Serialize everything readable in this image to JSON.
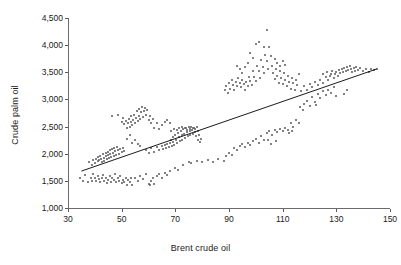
{
  "chart_data": {
    "type": "scatter",
    "title": "",
    "xlabel": "Brent crude oil",
    "ylabel": "Crude palm oil",
    "xlim": [
      30,
      150
    ],
    "ylim": [
      1000,
      4500
    ],
    "xticks": [
      30,
      50,
      70,
      90,
      110,
      130,
      150
    ],
    "xtick_labels": [
      "30",
      "50",
      "70",
      "90",
      "110",
      "130",
      "150"
    ],
    "yticks": [
      1000,
      1500,
      2000,
      2500,
      3000,
      3500,
      4000,
      4500
    ],
    "ytick_labels": [
      "1,000",
      "1,500",
      "2,000",
      "2,500",
      "3,000",
      "3,500",
      "4,000",
      "4,500"
    ],
    "grid": false,
    "legend": null,
    "marker_color": "#58595b",
    "line_color": "#000000",
    "trendline": {
      "x": [
        35,
        145
      ],
      "y": [
        1680,
        3560
      ]
    },
    "points": [
      [
        34.5,
        1555
      ],
      [
        35.5,
        1500
      ],
      [
        36.5,
        1600
      ],
      [
        37.5,
        1470
      ],
      [
        38.5,
        1560
      ],
      [
        39.0,
        1505
      ],
      [
        39.5,
        1620
      ],
      [
        40.0,
        1545
      ],
      [
        40.5,
        1490
      ],
      [
        41.0,
        1585
      ],
      [
        41.5,
        1530
      ],
      [
        42.0,
        1470
      ],
      [
        42.5,
        1560
      ],
      [
        43.0,
        1600
      ],
      [
        43.5,
        1505
      ],
      [
        44.0,
        1545
      ],
      [
        44.5,
        1455
      ],
      [
        45.0,
        1520
      ],
      [
        45.5,
        1590
      ],
      [
        46.0,
        1475
      ],
      [
        46.5,
        1550
      ],
      [
        47.0,
        1510
      ],
      [
        47.5,
        1620
      ],
      [
        48.0,
        1470
      ],
      [
        48.5,
        1545
      ],
      [
        49.0,
        1500
      ],
      [
        49.5,
        1590
      ],
      [
        50.0,
        1455
      ],
      [
        50.5,
        1520
      ],
      [
        51.0,
        1480
      ],
      [
        51.5,
        1560
      ],
      [
        52.0,
        1430
      ],
      [
        52.5,
        1510
      ],
      [
        53.0,
        1470
      ],
      [
        53.5,
        1545
      ],
      [
        54.0,
        1425
      ],
      [
        55.0,
        1560
      ],
      [
        56.0,
        1505
      ],
      [
        57.0,
        1590
      ],
      [
        58.0,
        1540
      ],
      [
        59.0,
        1620
      ],
      [
        60.0,
        1445
      ],
      [
        60.5,
        1420
      ],
      [
        61.0,
        1490
      ],
      [
        61.5,
        1560
      ],
      [
        62.0,
        1440
      ],
      [
        63.0,
        1590
      ],
      [
        64.0,
        1620
      ],
      [
        65.0,
        1560
      ],
      [
        66.0,
        1650
      ],
      [
        67.0,
        1600
      ],
      [
        68.0,
        1680
      ],
      [
        70.0,
        1740
      ],
      [
        71.0,
        1700
      ],
      [
        73.0,
        1790
      ],
      [
        75.0,
        1845
      ],
      [
        76.0,
        1820
      ],
      [
        78.0,
        1860
      ],
      [
        38.0,
        1840
      ],
      [
        39.0,
        1790
      ],
      [
        39.5,
        1880
      ],
      [
        40.0,
        1830
      ],
      [
        40.5,
        1905
      ],
      [
        41.0,
        1860
      ],
      [
        41.3,
        1935
      ],
      [
        41.6,
        1880
      ],
      [
        42.0,
        1960
      ],
      [
        42.3,
        1905
      ],
      [
        42.6,
        1845
      ],
      [
        43.0,
        1990
      ],
      [
        43.3,
        1930
      ],
      [
        43.6,
        1875
      ],
      [
        44.0,
        2015
      ],
      [
        44.2,
        1955
      ],
      [
        44.5,
        1900
      ],
      [
        44.8,
        2040
      ],
      [
        45.0,
        1980
      ],
      [
        45.2,
        1925
      ],
      [
        45.5,
        2060
      ],
      [
        45.8,
        2000
      ],
      [
        46.0,
        1945
      ],
      [
        46.3,
        2085
      ],
      [
        46.6,
        2020
      ],
      [
        47.0,
        1960
      ],
      [
        47.3,
        2105
      ],
      [
        47.6,
        2045
      ],
      [
        48.0,
        1985
      ],
      [
        48.3,
        2125
      ],
      [
        48.6,
        2060
      ],
      [
        49.0,
        2000
      ],
      [
        49.5,
        2080
      ],
      [
        50.0,
        2040
      ],
      [
        50.5,
        2110
      ],
      [
        51.0,
        2055
      ],
      [
        46.5,
        2700
      ],
      [
        48.5,
        2720
      ],
      [
        50.0,
        2590
      ],
      [
        50.5,
        2650
      ],
      [
        51.0,
        2540
      ],
      [
        51.5,
        2610
      ],
      [
        52.0,
        2480
      ],
      [
        52.3,
        2560
      ],
      [
        52.6,
        2640
      ],
      [
        53.0,
        2500
      ],
      [
        53.3,
        2580
      ],
      [
        53.6,
        2690
      ],
      [
        54.0,
        2520
      ],
      [
        54.3,
        2620
      ],
      [
        54.6,
        2720
      ],
      [
        55.0,
        2560
      ],
      [
        55.3,
        2660
      ],
      [
        55.6,
        2780
      ],
      [
        56.0,
        2600
      ],
      [
        56.3,
        2700
      ],
      [
        56.6,
        2820
      ],
      [
        57.0,
        2640
      ],
      [
        57.3,
        2760
      ],
      [
        57.6,
        2860
      ],
      [
        58.0,
        2680
      ],
      [
        58.3,
        2790
      ],
      [
        58.6,
        2840
      ],
      [
        59.0,
        2720
      ],
      [
        59.5,
        2800
      ],
      [
        60.0,
        2620
      ],
      [
        60.5,
        2700
      ],
      [
        61.0,
        2560
      ],
      [
        61.5,
        2640
      ],
      [
        62.0,
        2480
      ],
      [
        63.0,
        2560
      ],
      [
        64.0,
        2460
      ],
      [
        65.0,
        2520
      ],
      [
        66.0,
        2580
      ],
      [
        67.0,
        2620
      ],
      [
        68.0,
        2560
      ],
      [
        52.0,
        2280
      ],
      [
        53.0,
        2340
      ],
      [
        54.0,
        2200
      ],
      [
        55.0,
        2260
      ],
      [
        56.0,
        2180
      ],
      [
        57.0,
        2140
      ],
      [
        59.0,
        2060
      ],
      [
        60.0,
        2020
      ],
      [
        61.0,
        2100
      ],
      [
        62.0,
        2040
      ],
      [
        63.0,
        2120
      ],
      [
        64.0,
        2060
      ],
      [
        65.0,
        2140
      ],
      [
        65.5,
        2080
      ],
      [
        66.0,
        2160
      ],
      [
        66.5,
        2100
      ],
      [
        67.0,
        2180
      ],
      [
        67.5,
        2120
      ],
      [
        68.0,
        2200
      ],
      [
        68.3,
        2260
      ],
      [
        68.6,
        2150
      ],
      [
        69.0,
        2300
      ],
      [
        69.3,
        2220
      ],
      [
        69.6,
        2160
      ],
      [
        70.0,
        2340
      ],
      [
        70.3,
        2260
      ],
      [
        70.6,
        2190
      ],
      [
        71.0,
        2380
      ],
      [
        71.3,
        2300
      ],
      [
        71.6,
        2230
      ],
      [
        72.0,
        2420
      ],
      [
        72.3,
        2340
      ],
      [
        72.6,
        2260
      ],
      [
        73.0,
        2450
      ],
      [
        73.3,
        2370
      ],
      [
        73.6,
        2290
      ],
      [
        74.0,
        2470
      ],
      [
        74.3,
        2400
      ],
      [
        74.6,
        2320
      ],
      [
        75.0,
        2490
      ],
      [
        75.3,
        2420
      ],
      [
        75.6,
        2350
      ],
      [
        76.0,
        2500
      ],
      [
        76.3,
        2440
      ],
      [
        76.6,
        2370
      ],
      [
        77.0,
        2470
      ],
      [
        77.3,
        2400
      ],
      [
        77.6,
        2330
      ],
      [
        78.0,
        2490
      ],
      [
        78.3,
        2420
      ],
      [
        78.6,
        2260
      ],
      [
        79.0,
        2350
      ],
      [
        79.3,
        2210
      ],
      [
        79.6,
        2280
      ],
      [
        68.5,
        2420
      ],
      [
        69.5,
        2460
      ],
      [
        70.5,
        2440
      ],
      [
        71.5,
        2480
      ],
      [
        72.5,
        2500
      ],
      [
        73.5,
        2470
      ],
      [
        74.5,
        2440
      ],
      [
        75.5,
        2460
      ],
      [
        76.5,
        2480
      ],
      [
        77.5,
        2450
      ],
      [
        80.0,
        1850
      ],
      [
        82.0,
        1880
      ],
      [
        84.0,
        1840
      ],
      [
        86.0,
        1900
      ],
      [
        88.0,
        1860
      ],
      [
        89.0,
        1960
      ],
      [
        90.0,
        2020
      ],
      [
        91.0,
        1980
      ],
      [
        92.0,
        2100
      ],
      [
        93.0,
        2060
      ],
      [
        94.0,
        2140
      ],
      [
        95.0,
        2180
      ],
      [
        96.0,
        2120
      ],
      [
        97.0,
        2200
      ],
      [
        98.0,
        2160
      ],
      [
        99.0,
        2240
      ],
      [
        100.0,
        2280
      ],
      [
        101.0,
        2200
      ],
      [
        102.0,
        2320
      ],
      [
        103.0,
        2260
      ],
      [
        104.0,
        2380
      ],
      [
        105.0,
        2420
      ],
      [
        106.0,
        2340
      ],
      [
        107.0,
        2440
      ],
      [
        108.0,
        2400
      ],
      [
        109.0,
        2460
      ],
      [
        110.0,
        2420
      ],
      [
        111.0,
        2480
      ],
      [
        112.0,
        2440
      ],
      [
        113.0,
        2560
      ],
      [
        114.0,
        2500
      ],
      [
        115.0,
        2620
      ],
      [
        116.0,
        2560
      ],
      [
        104.5,
        2260
      ],
      [
        105.5,
        2180
      ],
      [
        107.5,
        2240
      ],
      [
        112.5,
        2380
      ],
      [
        113.5,
        2420
      ],
      [
        88.5,
        3180
      ],
      [
        89.0,
        3240
      ],
      [
        89.5,
        3120
      ],
      [
        90.0,
        3300
      ],
      [
        90.5,
        3200
      ],
      [
        91.0,
        3350
      ],
      [
        91.5,
        3260
      ],
      [
        92.0,
        3180
      ],
      [
        92.5,
        3320
      ],
      [
        93.0,
        3240
      ],
      [
        93.5,
        3400
      ],
      [
        94.0,
        3300
      ],
      [
        94.5,
        3220
      ],
      [
        95.0,
        3360
      ],
      [
        95.5,
        3280
      ],
      [
        96.0,
        3180
      ],
      [
        96.5,
        3320
      ],
      [
        97.0,
        3240
      ],
      [
        97.5,
        3420
      ],
      [
        98.0,
        3340
      ],
      [
        98.5,
        3260
      ],
      [
        99.0,
        3520
      ],
      [
        99.5,
        3420
      ],
      [
        100.0,
        3340
      ],
      [
        100.5,
        3620
      ],
      [
        101.0,
        3520
      ],
      [
        101.5,
        3400
      ],
      [
        102.0,
        3720
      ],
      [
        102.5,
        3600
      ],
      [
        103.0,
        3480
      ],
      [
        103.5,
        3820
      ],
      [
        104.0,
        3700
      ],
      [
        104.5,
        3560
      ],
      [
        105.0,
        3960
      ],
      [
        105.5,
        3800
      ],
      [
        106.0,
        3620
      ],
      [
        100.0,
        4030
      ],
      [
        101.0,
        4060
      ],
      [
        103.0,
        3960
      ],
      [
        104.0,
        4280
      ],
      [
        98.0,
        3860
      ],
      [
        99.0,
        3760
      ],
      [
        97.0,
        3680
      ],
      [
        96.0,
        3600
      ],
      [
        106.5,
        3480
      ],
      [
        107.0,
        3380
      ],
      [
        107.5,
        3560
      ],
      [
        108.0,
        3440
      ],
      [
        108.5,
        3300
      ],
      [
        109.0,
        3520
      ],
      [
        109.5,
        3400
      ],
      [
        110.0,
        3280
      ],
      [
        110.5,
        3480
      ],
      [
        111.0,
        3360
      ],
      [
        111.5,
        3240
      ],
      [
        112.0,
        3440
      ],
      [
        112.5,
        3320
      ],
      [
        113.0,
        3200
      ],
      [
        113.5,
        3400
      ],
      [
        114.0,
        3300
      ],
      [
        114.5,
        3180
      ],
      [
        115.0,
        3360
      ],
      [
        115.5,
        3260
      ],
      [
        116.0,
        3460
      ],
      [
        107.0,
        3740
      ],
      [
        108.0,
        3680
      ],
      [
        109.0,
        3620
      ],
      [
        110.0,
        3700
      ],
      [
        111.0,
        3640
      ],
      [
        94.0,
        3560
      ],
      [
        95.0,
        3480
      ],
      [
        93.0,
        3620
      ],
      [
        117.0,
        3160
      ],
      [
        118.0,
        3240
      ],
      [
        119.0,
        3180
      ],
      [
        120.0,
        3280
      ],
      [
        121.0,
        3220
      ],
      [
        122.0,
        3320
      ],
      [
        123.0,
        3260
      ],
      [
        124.0,
        3360
      ],
      [
        125.0,
        3300
      ],
      [
        126.0,
        3420
      ],
      [
        127.0,
        3360
      ],
      [
        128.0,
        3460
      ],
      [
        129.0,
        3400
      ],
      [
        130.0,
        3500
      ],
      [
        130.5,
        3440
      ],
      [
        131.0,
        3540
      ],
      [
        131.5,
        3480
      ],
      [
        132.0,
        3560
      ],
      [
        132.5,
        3500
      ],
      [
        133.0,
        3580
      ],
      [
        133.5,
        3520
      ],
      [
        134.0,
        3600
      ],
      [
        134.5,
        3540
      ],
      [
        135.0,
        3620
      ],
      [
        135.5,
        3560
      ],
      [
        136.0,
        3500
      ],
      [
        136.5,
        3580
      ],
      [
        137.0,
        3520
      ],
      [
        137.5,
        3600
      ],
      [
        138.0,
        3540
      ],
      [
        139.0,
        3580
      ],
      [
        140.0,
        3520
      ],
      [
        141.0,
        3560
      ],
      [
        142.0,
        3500
      ],
      [
        143.0,
        3560
      ],
      [
        144.0,
        3540
      ],
      [
        145.0,
        3560
      ],
      [
        118.0,
        2920
      ],
      [
        119.0,
        2980
      ],
      [
        120.0,
        2880
      ],
      [
        121.0,
        3040
      ],
      [
        122.0,
        2960
      ],
      [
        123.0,
        3100
      ],
      [
        124.0,
        3020
      ],
      [
        125.0,
        3160
      ],
      [
        126.0,
        3080
      ],
      [
        127.0,
        3180
      ],
      [
        128.0,
        3120
      ],
      [
        129.0,
        3220
      ],
      [
        133.0,
        3100
      ],
      [
        134.0,
        3180
      ],
      [
        130.0,
        3060
      ],
      [
        116.5,
        2860
      ],
      [
        117.5,
        2800
      ],
      [
        122.5,
        2900
      ],
      [
        125.0,
        3460
      ],
      [
        126.5,
        3500
      ],
      [
        127.5,
        3440
      ],
      [
        128.5,
        3520
      ],
      [
        129.5,
        3460
      ]
    ]
  }
}
